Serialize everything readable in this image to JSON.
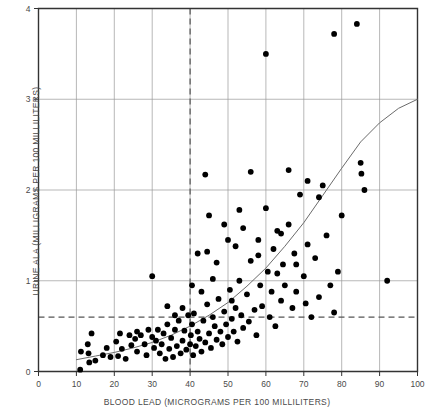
{
  "chart_data": {
    "type": "scatter",
    "title": "",
    "xlabel": "BLOOD LEAD (MICROGRAMS PER 100 MILLILITERS)",
    "ylabel": "URINE ALA (MILLIGRAMS PER 100 MILLILITERS)",
    "xlim": [
      0,
      100
    ],
    "ylim": [
      0,
      4
    ],
    "xticks": [
      0,
      10,
      20,
      30,
      40,
      50,
      60,
      70,
      80,
      90,
      100
    ],
    "yticks": [
      0,
      1,
      2,
      3,
      4
    ],
    "xtick_labels": [
      "0",
      "10",
      "20",
      "30",
      "40",
      "50",
      "60",
      "70",
      "80",
      "90",
      "100"
    ],
    "ytick_labels": [
      "0",
      "1",
      "2",
      "3",
      "4"
    ],
    "grid": true,
    "grid_color": "#9a9a9a",
    "legend": null,
    "point_color": "#000000",
    "point_size": 4.4,
    "curve_color": "#6b6b6b",
    "reference_lines": [
      {
        "orientation": "vertical",
        "value": 40,
        "style": "dashed",
        "color": "#555555"
      },
      {
        "orientation": "horizontal",
        "value": 0.6,
        "style": "dashed",
        "color": "#555555"
      }
    ],
    "fit_curve": {
      "label": "exponential fit",
      "points": [
        [
          10,
          0.13
        ],
        [
          15,
          0.17
        ],
        [
          20,
          0.21
        ],
        [
          25,
          0.26
        ],
        [
          30,
          0.32
        ],
        [
          35,
          0.4
        ],
        [
          40,
          0.5
        ],
        [
          45,
          0.62
        ],
        [
          50,
          0.76
        ],
        [
          55,
          0.94
        ],
        [
          60,
          1.14
        ],
        [
          65,
          1.38
        ],
        [
          70,
          1.64
        ],
        [
          75,
          1.94
        ],
        [
          80,
          2.24
        ],
        [
          85,
          2.53
        ],
        [
          90,
          2.74
        ],
        [
          95,
          2.9
        ],
        [
          100,
          3.0
        ]
      ]
    },
    "points": [
      [
        11.0,
        0.02
      ],
      [
        11.2,
        0.22
      ],
      [
        13.0,
        0.3
      ],
      [
        13.2,
        0.2
      ],
      [
        13.4,
        0.1
      ],
      [
        14.0,
        0.42
      ],
      [
        15.0,
        0.12
      ],
      [
        17.0,
        0.18
      ],
      [
        19.0,
        0.16
      ],
      [
        20.5,
        0.33
      ],
      [
        21.0,
        0.17
      ],
      [
        22.0,
        0.25
      ],
      [
        23.0,
        0.14
      ],
      [
        24.5,
        0.29
      ],
      [
        25.5,
        0.36
      ],
      [
        26.0,
        0.22
      ],
      [
        27.0,
        0.4
      ],
      [
        28.0,
        0.3
      ],
      [
        28.5,
        0.18
      ],
      [
        29.0,
        0.46
      ],
      [
        30.0,
        0.38
      ],
      [
        30.5,
        0.26
      ],
      [
        31.0,
        0.34
      ],
      [
        31.5,
        0.46
      ],
      [
        32.0,
        0.2
      ],
      [
        32.5,
        0.3
      ],
      [
        33.0,
        0.42
      ],
      [
        33.5,
        0.14
      ],
      [
        34.0,
        0.52
      ],
      [
        34.5,
        0.25
      ],
      [
        35.0,
        0.37
      ],
      [
        35.5,
        0.16
      ],
      [
        36.0,
        0.46
      ],
      [
        36.5,
        0.28
      ],
      [
        37.0,
        0.56
      ],
      [
        37.5,
        0.2
      ],
      [
        38.0,
        0.34
      ],
      [
        38.5,
        0.45
      ],
      [
        39.0,
        0.24
      ],
      [
        39.5,
        0.62
      ],
      [
        30.0,
        1.05
      ],
      [
        40.0,
        0.3
      ],
      [
        40.2,
        0.4
      ],
      [
        40.5,
        0.52
      ],
      [
        40.8,
        0.18
      ],
      [
        41.0,
        0.64
      ],
      [
        41.5,
        0.28
      ],
      [
        42.0,
        0.44
      ],
      [
        42.5,
        0.36
      ],
      [
        43.0,
        0.22
      ],
      [
        43.5,
        0.56
      ],
      [
        44.0,
        0.32
      ],
      [
        44.5,
        0.74
      ],
      [
        45.0,
        0.42
      ],
      [
        45.5,
        0.26
      ],
      [
        46.0,
        0.6
      ],
      [
        46.5,
        0.5
      ],
      [
        47.0,
        0.35
      ],
      [
        47.5,
        0.8
      ],
      [
        48.0,
        0.44
      ],
      [
        48.5,
        0.3
      ],
      [
        49.0,
        0.66
      ],
      [
        49.5,
        0.52
      ],
      [
        50.0,
        0.38
      ],
      [
        50.5,
        0.9
      ],
      [
        51.0,
        0.58
      ],
      [
        51.5,
        0.44
      ],
      [
        52.0,
        0.7
      ],
      [
        52.5,
        0.33
      ],
      [
        53.0,
        1.0
      ],
      [
        53.5,
        0.62
      ],
      [
        54.0,
        0.48
      ],
      [
        55.0,
        0.85
      ],
      [
        55.5,
        0.55
      ],
      [
        56.0,
        1.22
      ],
      [
        57.0,
        0.68
      ],
      [
        57.5,
        0.4
      ],
      [
        58.0,
        1.45
      ],
      [
        58.5,
        0.95
      ],
      [
        59.0,
        0.72
      ],
      [
        60.0,
        1.8
      ],
      [
        60.5,
        1.1
      ],
      [
        61.0,
        0.6
      ],
      [
        61.5,
        0.88
      ],
      [
        62.0,
        1.35
      ],
      [
        62.5,
        0.5
      ],
      [
        63.0,
        1.55
      ],
      [
        64.0,
        0.78
      ],
      [
        64.5,
        1.18
      ],
      [
        65.0,
        0.95
      ],
      [
        66.0,
        1.62
      ],
      [
        67.0,
        0.7
      ],
      [
        67.5,
        1.3
      ],
      [
        68.0,
        0.88
      ],
      [
        69.0,
        1.95
      ],
      [
        70.0,
        1.05
      ],
      [
        70.5,
        0.75
      ],
      [
        71.0,
        1.4
      ],
      [
        72.0,
        0.6
      ],
      [
        73.0,
        1.25
      ],
      [
        74.0,
        0.82
      ],
      [
        75.0,
        2.05
      ],
      [
        76.0,
        1.5
      ],
      [
        77.0,
        0.95
      ],
      [
        78.0,
        0.65
      ],
      [
        79.0,
        1.1
      ],
      [
        80.0,
        1.72
      ],
      [
        44.0,
        2.17
      ],
      [
        50.0,
        1.45
      ],
      [
        56.0,
        2.2
      ],
      [
        60.0,
        3.5
      ],
      [
        66.0,
        2.22
      ],
      [
        71.0,
        2.1
      ],
      [
        74.0,
        1.92
      ],
      [
        78.0,
        3.72
      ],
      [
        84.0,
        3.83
      ],
      [
        85.0,
        2.3
      ],
      [
        85.2,
        2.18
      ],
      [
        86.0,
        2.0
      ],
      [
        92.0,
        1.0
      ],
      [
        42.0,
        1.3
      ],
      [
        44.5,
        1.32
      ],
      [
        47.0,
        1.2
      ],
      [
        52.0,
        1.38
      ],
      [
        54.0,
        1.58
      ],
      [
        58.0,
        1.28
      ],
      [
        63.0,
        1.08
      ],
      [
        45.0,
        1.72
      ],
      [
        49.0,
        1.62
      ],
      [
        53.0,
        1.78
      ],
      [
        64.0,
        1.52
      ],
      [
        68.0,
        1.18
      ],
      [
        40.5,
        0.95
      ],
      [
        43.0,
        0.88
      ],
      [
        46.0,
        1.02
      ],
      [
        51.0,
        0.78
      ],
      [
        34.0,
        0.72
      ],
      [
        36.0,
        0.62
      ],
      [
        38.0,
        0.7
      ],
      [
        26.0,
        0.44
      ],
      [
        24.0,
        0.4
      ],
      [
        21.5,
        0.42
      ],
      [
        18.0,
        0.26
      ]
    ]
  }
}
